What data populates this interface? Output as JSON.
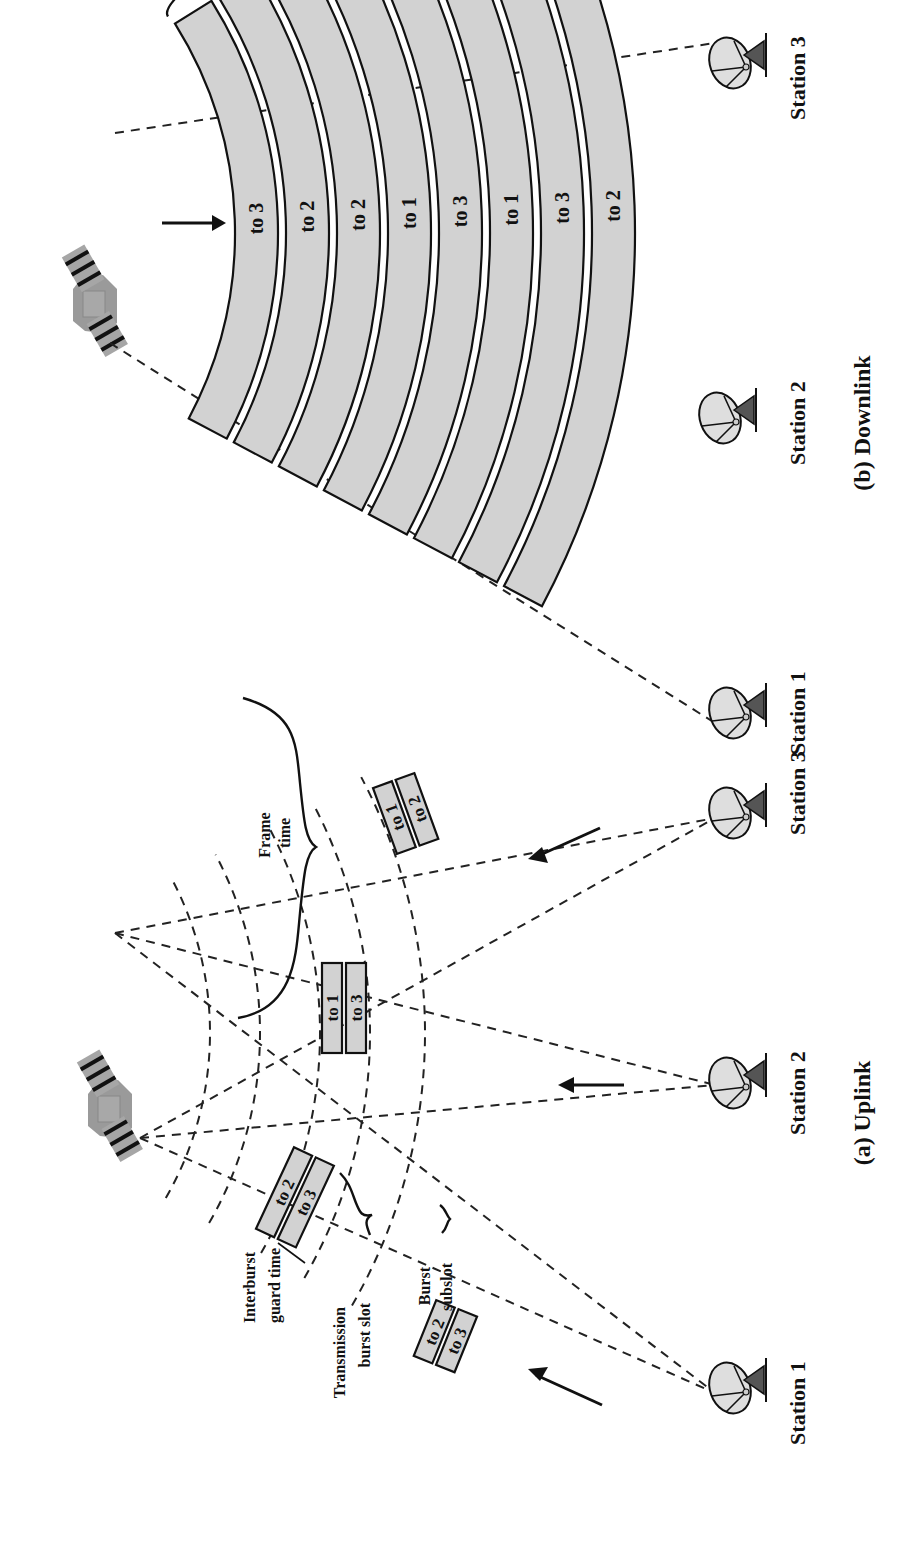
{
  "figure": {
    "orientation": "rotated 90 degrees counter-clockwise",
    "colors": {
      "band_fill": "#d2d2d2",
      "stroke": "#111111",
      "background": "#ffffff"
    }
  },
  "uplink": {
    "caption": "(a) Uplink",
    "stations": [
      "Station 1",
      "Station 2",
      "Station 3"
    ],
    "annotations": {
      "frame_time": [
        "Frame",
        "time"
      ],
      "interburst_guard_time": [
        "Interburst",
        "guard time"
      ],
      "transmission_burst_slot": [
        "Transmission",
        "burst slot"
      ],
      "burst_subslot": [
        "Burst",
        "subslot"
      ]
    },
    "bursts": [
      {
        "station": "Station 1",
        "near_sat": [
          "to 2",
          "to 3"
        ],
        "near_ground": [
          "to 2",
          "to 3"
        ]
      },
      {
        "station": "Station 2",
        "slots": [
          "to 1",
          "to 3"
        ]
      },
      {
        "station": "Station 3",
        "slots": [
          "to 1",
          "to 2"
        ]
      }
    ],
    "station1_slot_a": [
      "to 2",
      "to 3"
    ],
    "station1_slot_b": [
      "to 2",
      "to 3"
    ],
    "station2_slot": [
      "to 1",
      "to 3"
    ],
    "station3_slot": [
      "to 1",
      "to 2"
    ]
  },
  "downlink": {
    "caption": "(b) Downlink",
    "stations": [
      "Station 1",
      "Station 2",
      "Station 3"
    ],
    "groups": [
      {
        "label": [
          "Transmission",
          "from station 1"
        ],
        "bands": [
          "to 3",
          "to 2"
        ]
      },
      {
        "label": [
          "Transmission",
          "from station 3"
        ],
        "bands": [
          "to 2",
          "to 1"
        ]
      },
      {
        "label": [
          "Transmission",
          "from station 2"
        ],
        "bands": [
          "to 3",
          "to 1"
        ]
      },
      {
        "label": [
          "Transmission",
          "from station 1"
        ],
        "bands": [
          "to 3",
          "to 2"
        ]
      }
    ],
    "bands": [
      "to 3",
      "to 2",
      "to 2",
      "to 1",
      "to 3",
      "to 1",
      "to 3",
      "to 2"
    ]
  }
}
